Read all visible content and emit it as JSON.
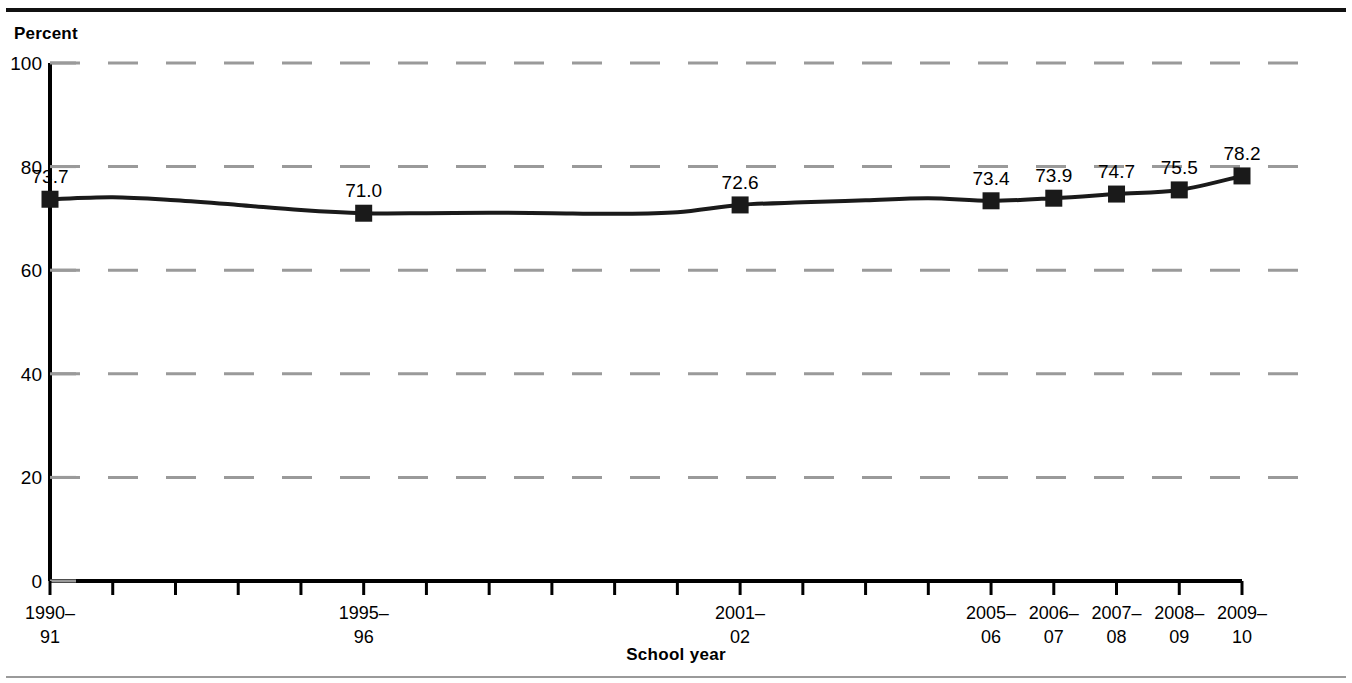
{
  "figure": {
    "y_axis_title": "Percent",
    "x_axis_title": "School year"
  },
  "chart_data": {
    "type": "line",
    "title": "",
    "subtitle": "",
    "xlabel": "School year",
    "ylabel": "Percent",
    "ylim": [
      0,
      100
    ],
    "yticks": [
      0,
      20,
      40,
      60,
      80,
      100
    ],
    "ytick_labels": [
      "0",
      "20",
      "40",
      "60",
      "80",
      "100"
    ],
    "grid": "horizontal-dashed",
    "legend": "none",
    "categories": [
      "1990–91",
      "1991–92",
      "1992–93",
      "1993–94",
      "1994–95",
      "1995–96",
      "1996–97",
      "1997–98",
      "1998–99",
      "1999–2000",
      "2000–01",
      "2001–02",
      "2002–03",
      "2003–04",
      "2004–05",
      "2005–06",
      "2006–07",
      "2007–08",
      "2008–09",
      "2009–10"
    ],
    "xtick_labels_visible": [
      {
        "index": 0,
        "line1": "1990–",
        "line2": "91"
      },
      {
        "index": 5,
        "line1": "1995–",
        "line2": "96"
      },
      {
        "index": 11,
        "line1": "2001–",
        "line2": "02"
      },
      {
        "index": 15,
        "line1": "2005–",
        "line2": "06"
      },
      {
        "index": 16,
        "line1": "2006–",
        "line2": "07"
      },
      {
        "index": 17,
        "line1": "2007–",
        "line2": "08"
      },
      {
        "index": 18,
        "line1": "2008–",
        "line2": "09"
      },
      {
        "index": 19,
        "line1": "2009–",
        "line2": "10"
      }
    ],
    "series": [
      {
        "name": "Percent",
        "values": [
          73.7,
          74.1,
          73.5,
          72.6,
          71.6,
          71.0,
          71.0,
          71.1,
          71.0,
          70.9,
          71.2,
          72.6,
          73.1,
          73.5,
          73.9,
          73.4,
          73.9,
          74.7,
          75.5,
          78.2
        ]
      }
    ],
    "labeled_points": [
      {
        "index": 0,
        "category": "1990–91",
        "value": 73.7,
        "label": "73.7"
      },
      {
        "index": 5,
        "category": "1995–96",
        "value": 71.0,
        "label": "71.0"
      },
      {
        "index": 11,
        "category": "2001–02",
        "value": 72.6,
        "label": "72.6"
      },
      {
        "index": 15,
        "category": "2005–06",
        "value": 73.4,
        "label": "73.4"
      },
      {
        "index": 16,
        "category": "2006–07",
        "value": 73.9,
        "label": "73.9"
      },
      {
        "index": 17,
        "category": "2007–08",
        "value": 74.7,
        "label": "74.7"
      },
      {
        "index": 18,
        "category": "2008–09",
        "value": 75.5,
        "label": "75.5"
      },
      {
        "index": 19,
        "category": "2009–10",
        "value": 78.2,
        "label": "78.2"
      }
    ],
    "colors": {
      "line": "#1a1a1a",
      "marker": "#1a1a1a",
      "grid": "#9a9a9a",
      "axis": "#000000",
      "background": "#ffffff"
    }
  }
}
